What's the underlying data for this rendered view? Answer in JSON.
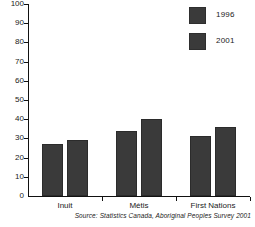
{
  "chart_data": {
    "type": "bar",
    "title": "",
    "subtitle": "",
    "xlabel": "",
    "ylabel": "",
    "categories": [
      "Inuit",
      "Métis",
      "First Nations"
    ],
    "series": [
      {
        "name": "1996",
        "values": [
          27,
          34,
          31
        ],
        "color": "#3a3a3a"
      },
      {
        "name": "2001",
        "values": [
          29,
          40,
          36
        ],
        "color": "#3a3a3a"
      }
    ],
    "ylim": [
      0,
      100
    ],
    "ytick_step": 10,
    "ytick_labels": [
      "0",
      "10",
      "20",
      "30",
      "40",
      "50",
      "60",
      "70",
      "80",
      "90",
      "100"
    ],
    "grid": false,
    "legend_position": "top-right",
    "annotations": {
      "source": "Source: Statistics Canada, Aboriginal Peoples Survey 2001"
    }
  },
  "legend": {
    "items": [
      {
        "label": "1996",
        "swatch": "legend-swatch-1996"
      },
      {
        "label": "2001",
        "swatch": "legend-swatch-2001"
      }
    ]
  },
  "colors": {
    "bar": "#3a3a3a",
    "axis": "#111111",
    "background": "#ffffff",
    "text": "#1a1a1a"
  }
}
